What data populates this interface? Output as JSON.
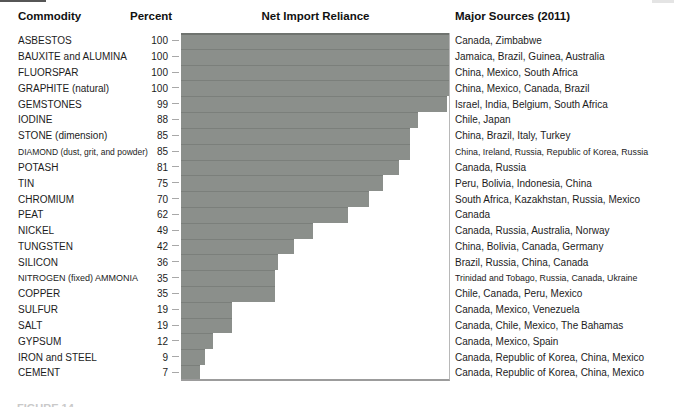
{
  "header": {
    "commodity": "Commodity",
    "percent": "Percent",
    "chart_title": "Net Import Reliance",
    "sources": "Major Sources (2011)"
  },
  "colors": {
    "bar": "#8b8f8b",
    "bar_divider": "#7b7f7b",
    "plot_right_border": "#b8b8b8",
    "plot_bottom_border": "#9c9c9c",
    "tick": "#a8a8a8",
    "text": "#1c1c1c"
  },
  "chart_data": {
    "type": "bar",
    "orientation": "horizontal",
    "title": "Net Import Reliance",
    "xlabel": "Percent",
    "xlim": [
      0,
      100
    ],
    "grid": false,
    "categories": [
      "ASBESTOS",
      "BAUXITE and ALUMINA",
      "FLUORSPAR",
      "GRAPHITE (natural)",
      "GEMSTONES",
      "IODINE",
      "STONE (dimension)",
      "DIAMOND (dust, grit, and powder)",
      "POTASH",
      "TIN",
      "CHROMIUM",
      "PEAT",
      "NICKEL",
      "TUNGSTEN",
      "SILICON",
      "NITROGEN (fixed) AMMONIA",
      "COPPER",
      "SULFUR",
      "SALT",
      "GYPSUM",
      "IRON and STEEL",
      "CEMENT"
    ],
    "values": [
      100,
      100,
      100,
      100,
      99,
      88,
      85,
      85,
      81,
      75,
      70,
      62,
      49,
      42,
      36,
      35,
      35,
      19,
      19,
      12,
      9,
      7
    ],
    "major_sources": [
      "Canada, Zimbabwe",
      "Jamaica, Brazil, Guinea, Australia",
      "China, Mexico, South Africa",
      "China, Mexico, Canada, Brazil",
      "Israel, India, Belgium, South Africa",
      "Chile, Japan",
      "China, Brazil, Italy, Turkey",
      "China, Ireland, Russia, Republic of Korea, Russia",
      "Canada, Russia",
      "Peru, Bolivia, Indonesia, China",
      "South Africa, Kazakhstan, Russia, Mexico",
      "Canada",
      "Canada, Russia, Australia, Norway",
      "China, Bolivia, Canada, Germany",
      "Brazil, Russia, China, Canada",
      "Trinidad and Tobago, Russia, Canada, Ukraine",
      "Chile, Canada, Peru, Mexico",
      "Canada, Mexico, Venezuela",
      "Canada, Chile, Mexico, The Bahamas",
      "Canada, Mexico, Spain",
      "Canada, Republic of Korea, China, Mexico",
      "Canada, Republic of Korea, China, Mexico"
    ]
  },
  "caption_clipped": "FIGURE 14"
}
